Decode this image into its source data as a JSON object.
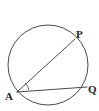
{
  "figure": {
    "background_color": "#ffffff",
    "stroke_color": "#4a4a4a",
    "label_color": "#232323"
  },
  "circle": {
    "name": "circle-outline",
    "center_x": 48,
    "center_y": 65,
    "radius": 40,
    "stroke_color": "#4a4a4a",
    "stroke_width": 1
  },
  "points": {
    "A": {
      "label": "A",
      "x": 17,
      "y": 92,
      "label_x": 5,
      "label_y": 100
    },
    "P": {
      "label": "P",
      "x": 75,
      "y": 39,
      "label_x": 76,
      "label_y": 38
    },
    "Q": {
      "label": "Q",
      "x": 87,
      "y": 87,
      "label_x": 88,
      "label_y": 93
    }
  },
  "segments": [
    {
      "name": "chord-AP",
      "from": "A",
      "to": "P",
      "x1": 17,
      "y1": 92,
      "x2": 75,
      "y2": 39
    },
    {
      "name": "chord-AQ",
      "from": "A",
      "to": "Q",
      "x1": 17,
      "y1": 92,
      "x2": 87,
      "y2": 87
    }
  ],
  "angle_mark": {
    "name": "angle-arc-A",
    "at": "A",
    "path": "M 28 89 A 12 12 0 0 0 24 83"
  }
}
